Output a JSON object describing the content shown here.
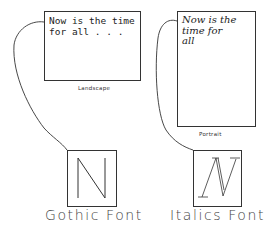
{
  "landscape": {
    "text_line1": "Now is the time",
    "text_line2": "for all . . .",
    "caption": "Landscape"
  },
  "portrait": {
    "text_line1": "Now is the",
    "text_line2": "time for",
    "text_line3": "all",
    "caption": "Portrait"
  },
  "gothic": {
    "glyph": "N",
    "caption": "Gothic Font"
  },
  "italics": {
    "glyph": "N",
    "caption": "Italics Font"
  },
  "colors": {
    "stroke": "#333333",
    "background": "#ffffff"
  }
}
